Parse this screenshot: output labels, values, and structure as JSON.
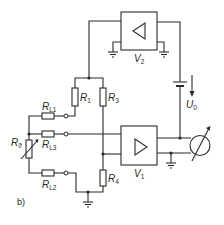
{
  "figure": {
    "caption": "b)",
    "colors": {
      "ink": "#2a2a2a",
      "background": "#ffffff"
    }
  },
  "components": {
    "amplifier_top": {
      "label": "V",
      "sub": "2",
      "symbol": "triangle-left"
    },
    "amplifier_bottom": {
      "label": "V",
      "sub": "1",
      "symbol": "triangle-right"
    },
    "r1": {
      "label": "R",
      "sub": "1"
    },
    "r3": {
      "label": "R",
      "sub": "3"
    },
    "r4": {
      "label": "R",
      "sub": "4"
    },
    "rl1": {
      "label": "R",
      "sub": "L1"
    },
    "rl2": {
      "label": "R",
      "sub": "L2"
    },
    "rl3": {
      "label": "R",
      "sub": "L3"
    },
    "rtheta": {
      "label": "R",
      "sub": "ϑ"
    },
    "voltage": {
      "label": "U",
      "sub": "0"
    }
  }
}
